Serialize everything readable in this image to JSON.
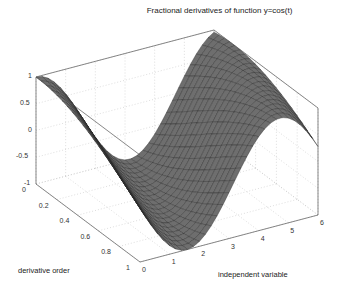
{
  "chart_data": {
    "type": "surface3d",
    "title": "Fractional derivatives of function y=cos(t)",
    "xlabel": "independent variable",
    "ylabel": "derivative order",
    "zlabel": "",
    "x_ticks": [
      "0",
      "1",
      "2",
      "3",
      "4",
      "5",
      "6"
    ],
    "y_ticks": [
      "0",
      "0.2",
      "0.4",
      "0.6",
      "0.8",
      "1"
    ],
    "z_ticks": [
      "-1",
      "-0.5",
      "0",
      "0.5",
      "1"
    ],
    "xlim": [
      0,
      6
    ],
    "ylim": [
      0,
      1
    ],
    "zlim": [
      -1,
      1
    ],
    "surface_function": "D^alpha cos(t) = cos(t + alpha*pi/2)",
    "x": [
      0,
      0.5,
      1,
      1.5,
      2,
      2.5,
      3,
      3.5,
      4,
      4.5,
      5,
      5.5,
      6
    ],
    "y": [
      0,
      0.2,
      0.4,
      0.6,
      0.8,
      1.0
    ],
    "grid": true,
    "colormap": "gray",
    "view": "3d box"
  },
  "labels": {
    "title": "Fractional derivatives of function y=cos(t)",
    "xlabel": "independent variable",
    "ylabel": "derivative order"
  }
}
